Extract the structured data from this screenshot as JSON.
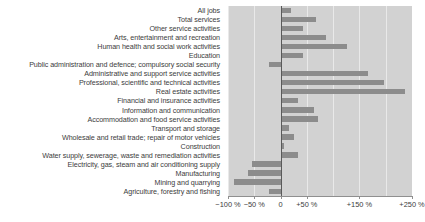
{
  "chart_data": {
    "type": "bar",
    "orientation": "horizontal",
    "title": "",
    "subtitle": "",
    "xlabel": "",
    "ylabel": "",
    "xlim": [
      -100,
      250
    ],
    "grid": true,
    "legend": null,
    "colors": {
      "bar": "#8c8c8c",
      "plot_background": "#d2d2d2",
      "gridline": "#e9e9e9",
      "zero_line": "#5a5a5a",
      "text": "#3c3c3c"
    },
    "xticks": [
      {
        "value": -100,
        "label": "−100 %"
      },
      {
        "value": -50,
        "label": "−50 %"
      },
      {
        "value": 0,
        "label": "0"
      },
      {
        "value": 50,
        "label": "+50 %"
      },
      {
        "value": 150,
        "label": "+150 %"
      },
      {
        "value": 250,
        "label": "+250 %"
      }
    ],
    "gridline_values": [
      -100,
      -50,
      50,
      100,
      150,
      200,
      250
    ],
    "categories": [
      "All jobs",
      "Total services",
      "Other service activities",
      "Arts, entertainment and recreation",
      "Human health and social work activities",
      "Education",
      "Public administration and defence; compulsory social security",
      "Administrative and support service activities",
      "Professional, scientific and technical activities",
      "Real estate activities",
      "Financial and insurance activities",
      "Information and communication",
      "Accommodation and food service activities",
      "Transport and storage",
      "Wholesale and retail trade; repair of motor vehicles",
      "Construction",
      "Water supply, sewerage, waste and remediation activities",
      "Electricity, gas, steam and air conditioning supply",
      "Manufacturing",
      "Mining and quarrying",
      "Agriculture, forestry and fishing"
    ],
    "values": [
      20,
      67,
      43,
      86,
      127,
      42,
      -22,
      167,
      196,
      237,
      34,
      63,
      72,
      16,
      26,
      6,
      33,
      -55,
      -62,
      -88,
      -22
    ],
    "units": "percent"
  }
}
